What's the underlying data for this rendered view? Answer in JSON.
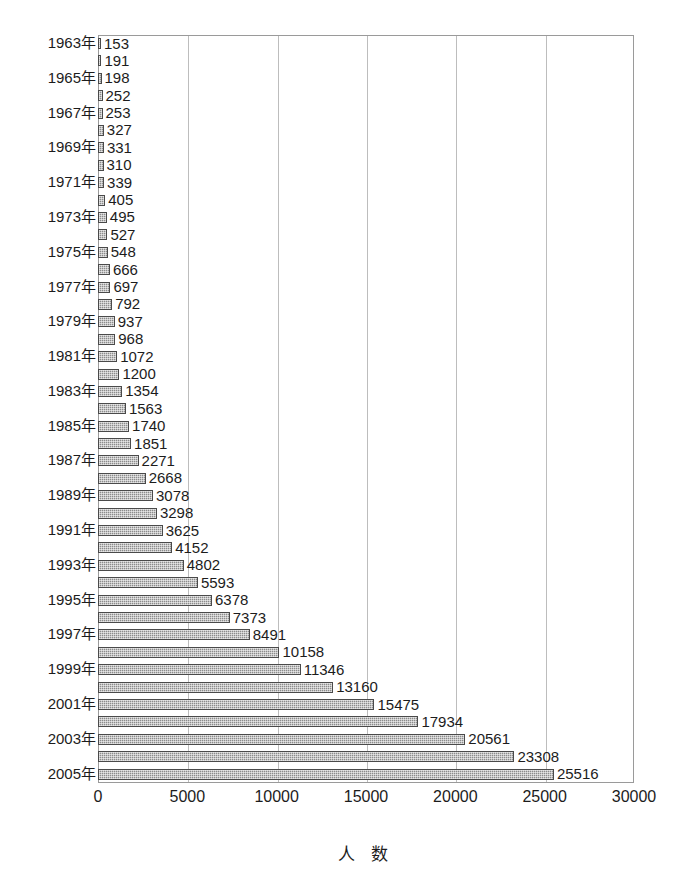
{
  "chart_data": {
    "type": "bar",
    "orientation": "horizontal",
    "title": "",
    "xlabel": "人 数",
    "ylabel": "",
    "xlim": [
      0,
      30000
    ],
    "xticks": [
      0,
      5000,
      10000,
      15000,
      20000,
      25000,
      30000
    ],
    "xtick_labels": [
      "0",
      "5000",
      "10000",
      "15000",
      "20000",
      "25000",
      "30000"
    ],
    "grid": true,
    "grid_axis": "x",
    "legend": "none",
    "bar_color": "#8c8c8c",
    "bar_edge_color": "#4a4a4a",
    "year_label_suffix": "年",
    "year_label_interval": 2,
    "categories": [
      "1963年",
      "1964年",
      "1965年",
      "1966年",
      "1967年",
      "1968年",
      "1969年",
      "1970年",
      "1971年",
      "1972年",
      "1973年",
      "1974年",
      "1975年",
      "1976年",
      "1977年",
      "1978年",
      "1979年",
      "1980年",
      "1981年",
      "1982年",
      "1983年",
      "1984年",
      "1985年",
      "1986年",
      "1987年",
      "1988年",
      "1989年",
      "1990年",
      "1991年",
      "1992年",
      "1993年",
      "1994年",
      "1995年",
      "1996年",
      "1997年",
      "1998年",
      "1999年",
      "2000年",
      "2001年",
      "2002年",
      "2003年",
      "2004年",
      "2005年"
    ],
    "values": [
      153,
      191,
      198,
      252,
      253,
      327,
      331,
      310,
      339,
      405,
      495,
      527,
      548,
      666,
      697,
      792,
      937,
      968,
      1072,
      1200,
      1354,
      1563,
      1740,
      1851,
      2271,
      2668,
      3078,
      3298,
      3625,
      4152,
      4802,
      5593,
      6378,
      7373,
      8491,
      10158,
      11346,
      13160,
      15475,
      17934,
      20561,
      23308,
      25516
    ],
    "data_labels": [
      "153",
      "191",
      "198",
      "252",
      "253",
      "327",
      "331",
      "310",
      "339",
      "405",
      "495",
      "527",
      "548",
      "666",
      "697",
      "792",
      "937",
      "968",
      "1072",
      "1200",
      "1354",
      "1563",
      "1740",
      "1851",
      "2271",
      "2668",
      "3078",
      "3298",
      "3625",
      "4152",
      "4802",
      "5593",
      "6378",
      "7373",
      "8491",
      "10158",
      "11346",
      "13160",
      "15475",
      "17934",
      "20561",
      "23308",
      "25516"
    ],
    "visible_year_labels": [
      "1963年",
      "1965年",
      "1967年",
      "1969年",
      "1971年",
      "1973年",
      "1975年",
      "1977年",
      "1979年",
      "1981年",
      "1983年",
      "1985年",
      "1987年",
      "1989年",
      "1991年",
      "1993年",
      "1995年",
      "1997年",
      "1999年",
      "2001年",
      "2003年",
      "2005年"
    ]
  }
}
